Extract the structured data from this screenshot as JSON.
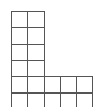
{
  "diagram": {
    "type": "grid-polyomino",
    "shape": "L",
    "origin": [
      11,
      11
    ],
    "cell_size": 16.3,
    "line_color": "#555555",
    "cells": [
      [
        0,
        0
      ],
      [
        0,
        1
      ],
      [
        1,
        0
      ],
      [
        1,
        1
      ],
      [
        2,
        0
      ],
      [
        2,
        1
      ],
      [
        3,
        0
      ],
      [
        3,
        1
      ],
      [
        4,
        0
      ],
      [
        4,
        1
      ],
      [
        4,
        2
      ],
      [
        4,
        3
      ],
      [
        4,
        4
      ],
      [
        5,
        0
      ],
      [
        5,
        1
      ],
      [
        5,
        2
      ],
      [
        5,
        3
      ],
      [
        5,
        4
      ]
    ]
  }
}
